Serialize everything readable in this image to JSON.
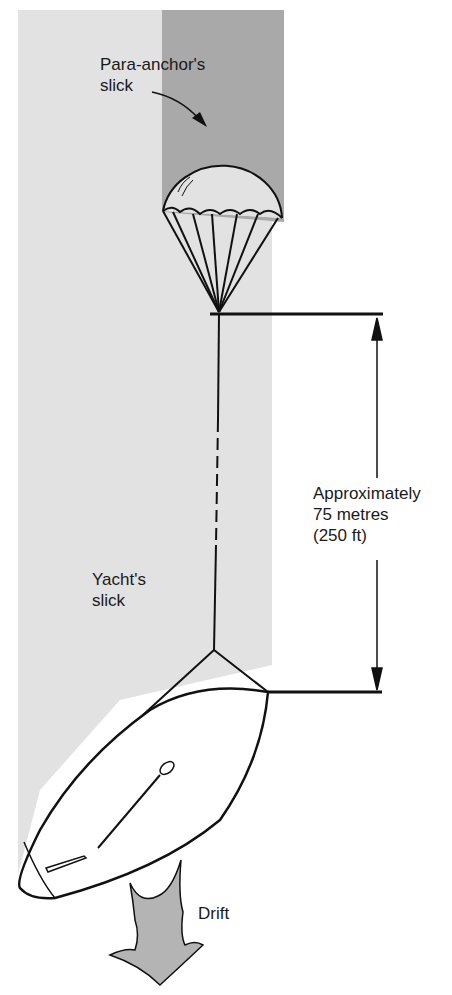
{
  "figure": {
    "labels": {
      "para_anchor_slick": "Para-anchor's\nslick",
      "yacht_slick": "Yacht's\nslick",
      "distance": "Approximately\n75 metres\n(250 ft)",
      "drift": "Drift"
    },
    "colors": {
      "yacht_slick": "#e2e2e2",
      "para_anchor_slick": "#a9a9a9",
      "drift_arrow": "#b4b4b4",
      "line": "#111111"
    },
    "distance_metres": 75,
    "distance_feet": 250
  }
}
